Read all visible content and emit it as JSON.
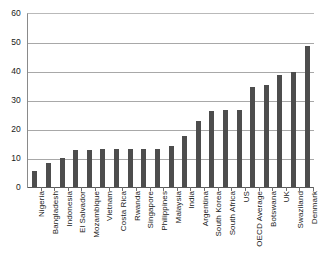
{
  "chart_data": {
    "type": "bar",
    "title": "",
    "subtitle": "",
    "xlabel": "",
    "ylabel": "",
    "ylim": [
      0,
      60
    ],
    "ytick_labels": [
      "0",
      "10",
      "20",
      "30",
      "40",
      "50",
      "60"
    ],
    "yticks": [
      0,
      10,
      20,
      30,
      40,
      50,
      60
    ],
    "grid": true,
    "gridlines_at": [
      10,
      20,
      30,
      40,
      50,
      60
    ],
    "legend": null,
    "legend_position": "none",
    "annotations": [],
    "bar_color": "#4d4d4d",
    "categories": [
      "Nigeria",
      "Bangladesh",
      "Indonesia",
      "El Salvador",
      "Mozambique",
      "Vietnam",
      "Costa Rica",
      "Rwanda",
      "Singapore",
      "Philippines",
      "Malaysia",
      "India",
      "Argentina",
      "South Korea",
      "South Africa",
      "US",
      "OECD Average",
      "Botswana",
      "UK",
      "Swaziland",
      "Denmark"
    ],
    "values": [
      6,
      8.5,
      10.5,
      13,
      13,
      13.5,
      13.5,
      13.5,
      13.5,
      13.5,
      14.5,
      18,
      23,
      26.5,
      27,
      27,
      35,
      35.5,
      39,
      40,
      49
    ]
  }
}
